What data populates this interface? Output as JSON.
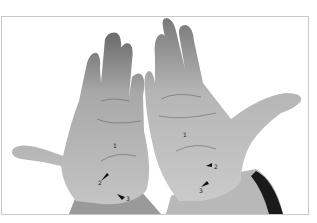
{
  "figure": {
    "background_color": "#ffffff",
    "border_color": "#c8c8c8",
    "left_hand": {
      "labels": [
        {
          "id": "1",
          "text": "1",
          "x": 112,
          "y": 142
        },
        {
          "id": "2",
          "text": "2",
          "x": 97,
          "y": 179
        },
        {
          "id": "3",
          "text": "3",
          "x": 124,
          "y": 195
        }
      ]
    },
    "right_hand": {
      "labels": [
        {
          "id": "1",
          "text": "1",
          "x": 182,
          "y": 131
        },
        {
          "id": "2",
          "text": "2",
          "x": 212,
          "y": 163
        },
        {
          "id": "3",
          "text": "3",
          "x": 198,
          "y": 187
        }
      ]
    }
  }
}
